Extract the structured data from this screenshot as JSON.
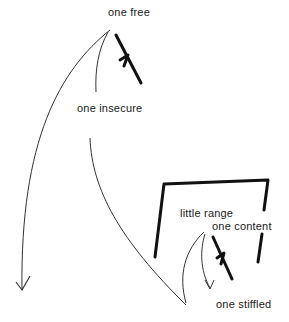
{
  "diagram": {
    "labels": {
      "one_free": "one free",
      "one_insecure": "one insecure",
      "little_range": "little range",
      "one_content": "one content",
      "one_stiffled": "one stiffled"
    },
    "colors": {
      "ink": "#1a1a1a",
      "thin_line": "#333333",
      "background": "#ffffff"
    }
  }
}
